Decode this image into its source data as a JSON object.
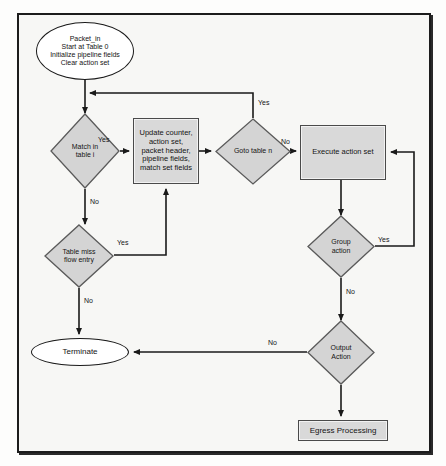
{
  "diagram": {
    "colors": {
      "process_fill": "#d9d9d9",
      "decision_fill": "#d4d4d4",
      "terminator_fill": "#ffffff",
      "stroke": "#1a1a1a",
      "canvas": "#f7f7f5"
    },
    "nodes": [
      {
        "id": "packet-in",
        "shape": "ellipse",
        "label": "Packet_in\nStart at Table 0\nInitialize pipeline fields\nClear action set"
      },
      {
        "id": "match-in-table",
        "shape": "diamond",
        "label": "Match in\ntable i"
      },
      {
        "id": "update-counter",
        "shape": "process",
        "label": "Update counter,\naction set,\npacket header,\npipeline fields,\nmatch set fields"
      },
      {
        "id": "goto-table",
        "shape": "diamond",
        "label": "Goto table n"
      },
      {
        "id": "execute-action-set",
        "shape": "process",
        "label": "Execute action set"
      },
      {
        "id": "table-miss",
        "shape": "diamond",
        "label": "Table miss\nflow entry"
      },
      {
        "id": "group-action",
        "shape": "diamond",
        "label": "Group\naction"
      },
      {
        "id": "output-action",
        "shape": "diamond",
        "label": "Output\nAction"
      },
      {
        "id": "terminate",
        "shape": "ellipse",
        "label": "Terminate"
      },
      {
        "id": "egress-processing",
        "shape": "process",
        "label": "Egress Processing"
      }
    ],
    "edge_labels": {
      "match_yes": "Yes",
      "match_no": "No",
      "goto_yes": "Yes",
      "goto_no": "No",
      "table_miss_yes": "Yes",
      "table_miss_no": "No",
      "group_yes": "Yes",
      "group_no": "No",
      "output_no": "No"
    }
  }
}
